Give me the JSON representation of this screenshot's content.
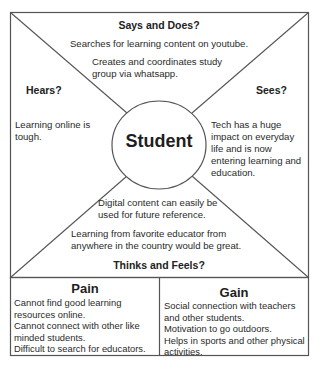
{
  "diagram": {
    "type": "empathy-map",
    "center_label": "Student",
    "colors": {
      "line": "#555555",
      "text": "#2a2a2a",
      "background": "#ffffff"
    },
    "quadrants": {
      "says_and_does": {
        "heading": "Says and Does?",
        "items": [
          "Searches for learning content on youtube.",
          "Creates and coordinates study",
          "group via whatsapp."
        ]
      },
      "hears": {
        "heading": "Hears?",
        "items": [
          "Learning online is",
          "tough."
        ]
      },
      "sees": {
        "heading": "Sees?",
        "items": [
          "Tech has a huge",
          "impact on everyday",
          "life and is now",
          "entering learning and",
          "education."
        ]
      },
      "thinks_and_feels": {
        "heading": "Thinks and Feels?",
        "items": [
          "Digital content can easily be",
          "used for future reference.",
          "Learning from favorite educator from",
          "anywhere in the country would be great."
        ]
      }
    },
    "pain": {
      "title": "Pain",
      "lines": [
        "Cannot find good learning",
        "resources online.",
        "Cannot connect with other like",
        "minded students.",
        "Difficult to search for educators."
      ]
    },
    "gain": {
      "title": "Gain",
      "lines": [
        "Social connection with teachers",
        "and other students.",
        "Motivation to  go outdoors.",
        "Helps in sports and other physical",
        "activities."
      ]
    }
  }
}
